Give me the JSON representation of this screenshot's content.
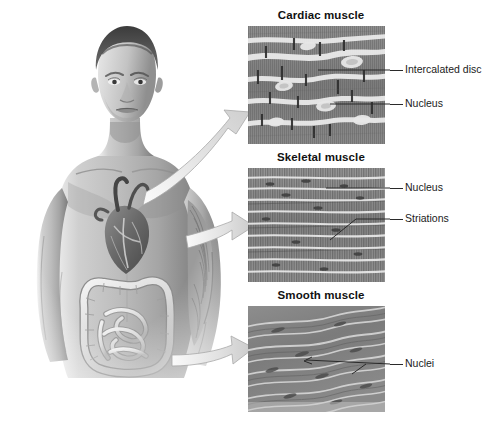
{
  "figure": {
    "alt": "Grayscale illustration of a human torso showing heart, intestines and arm muscle",
    "organs": [
      {
        "name": "heart",
        "muscle_type": "cardiac"
      },
      {
        "name": "biceps-brachii",
        "muscle_type": "skeletal"
      },
      {
        "name": "intestines",
        "muscle_type": "smooth"
      }
    ]
  },
  "panels": [
    {
      "id": "cardiac",
      "title": "Cardiac muscle",
      "tissue": "cardiac",
      "labels": [
        {
          "text": "Intercalated disc"
        },
        {
          "text": "Nucleus"
        }
      ]
    },
    {
      "id": "skeletal",
      "title": "Skeletal muscle",
      "tissue": "skeletal",
      "labels": [
        {
          "text": "Nucleus"
        },
        {
          "text": "Striations"
        }
      ]
    },
    {
      "id": "smooth",
      "title": "Smooth muscle",
      "tissue": "smooth",
      "labels": [
        {
          "text": "Nuclei"
        }
      ]
    }
  ],
  "arrows": [
    {
      "from": "heart",
      "to": "cardiac"
    },
    {
      "from": "biceps-brachii",
      "to": "skeletal"
    },
    {
      "from": "intestines",
      "to": "smooth"
    }
  ],
  "colors": {
    "background": "#ffffff",
    "text": "#1b1b1b",
    "leader": "#2a2a2a",
    "skin_light": "#d8d8d8",
    "skin_mid": "#a9a9a9",
    "skin_dark": "#6f6f6f",
    "arrow_fill": "#dcdcdc",
    "arrow_edge": "#9a9a9a",
    "tissue_dark": "#6d6d6d",
    "tissue_light": "#e6e6e6"
  }
}
